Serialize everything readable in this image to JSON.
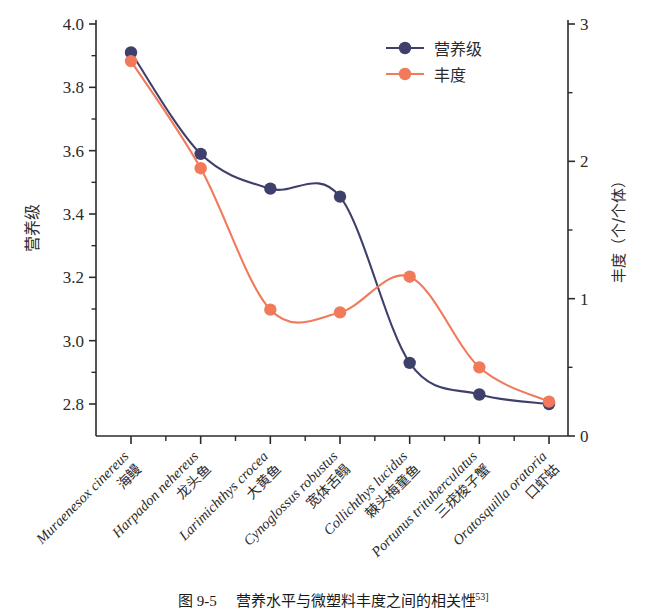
{
  "chart_data": {
    "type": "line",
    "title": "",
    "categories": [
      "Muraenesox cinereus",
      "Harpadon nehereus",
      "Larimichthys crocea",
      "Cynoglossus robustus",
      "Collichthys lucidus",
      "Portunus trituberculatus",
      "Oratosquilla oratoria"
    ],
    "categories_cn": [
      "海鳗",
      "龙头鱼",
      "大黄鱼",
      "宽体舌鳎",
      "棘头梅童鱼",
      "三疣梭子蟹",
      "口虾蛄"
    ],
    "series": [
      {
        "name": "营养级",
        "axis": "left",
        "color": "#3e3f6b",
        "values": [
          3.91,
          3.59,
          3.48,
          3.455,
          2.93,
          2.83,
          2.8
        ]
      },
      {
        "name": "丰度",
        "axis": "right",
        "color": "#f07a5a",
        "values": [
          2.73,
          1.95,
          0.92,
          0.9,
          1.16,
          0.5,
          0.25
        ]
      }
    ],
    "xlabel": "",
    "ylabel": "营养级",
    "ylabel_right": "丰度（个/个体）",
    "ylim": [
      2.8,
      4.0
    ],
    "ylim_right": [
      0,
      3
    ],
    "yticks": [
      "4.0",
      "3.8",
      "3.6",
      "3.4",
      "3.2",
      "3.0",
      "2.8"
    ],
    "ytick_values": [
      4.0,
      3.8,
      3.6,
      3.4,
      3.2,
      3.0,
      2.8
    ],
    "yticks_right": [
      "3",
      "2",
      "1",
      "0"
    ],
    "ytick_values_right": [
      3,
      2,
      1,
      0
    ],
    "grid": false,
    "legend_position": "top-right",
    "interpolation": "spline"
  },
  "legend": {
    "items": [
      {
        "label": "营养级",
        "color": "#3e3f6b"
      },
      {
        "label": "丰度",
        "color": "#f07a5a"
      }
    ]
  },
  "axes": {
    "left_title": "营养级",
    "right_title": "丰度（个/个体）"
  },
  "caption": {
    "figure_number": "图 9-5",
    "text": "营养水平与微塑料丰度之间的相关性",
    "reference": "[53]"
  }
}
